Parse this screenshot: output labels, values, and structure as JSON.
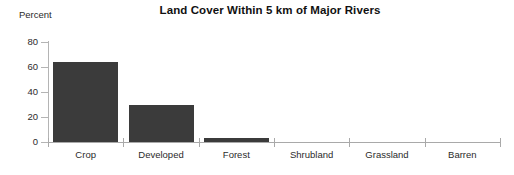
{
  "chart_data": {
    "type": "bar",
    "title": "Land Cover Within 5 km of Major Rivers",
    "xlabel": "",
    "ylabel": "Percent",
    "categories": [
      "Crop",
      "Developed",
      "Forest",
      "Shrubland",
      "Grassland",
      "Barren"
    ],
    "values": [
      64,
      30,
      3,
      0,
      0,
      0
    ],
    "ylim": [
      0,
      80
    ],
    "yticks": [
      0,
      20,
      40,
      60,
      80
    ],
    "ytick_labels": [
      "0",
      "20",
      "40",
      "60",
      "80"
    ],
    "grid": false,
    "legend": null,
    "bar_color": "#3b3b3b",
    "axis_color": "#a9a9a9",
    "text_color": "#2b2b2b",
    "background": "#ffffff"
  }
}
